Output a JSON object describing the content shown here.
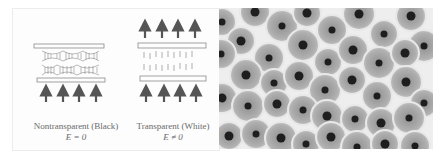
{
  "figure": {
    "left_panel": {
      "title": "Liquid crystal cell states",
      "cells": [
        {
          "name": "nontransparent",
          "label": "Nontransparent (Black)",
          "equation": "E = 0",
          "arrows_in": 4,
          "arrows_out": 0
        },
        {
          "name": "transparent",
          "label": "Transparent (White)",
          "equation": "E ≠ 0",
          "arrows_in": 4,
          "arrows_out": 4
        }
      ]
    },
    "right_panel": {
      "type": "micrograph",
      "description": "Hexagonally packed droplets with dark centers"
    },
    "colors": {
      "line": "#8a8a8a",
      "arrow": "#555555",
      "text": "#6a6a6a",
      "cell_bg": "#a9a9a9",
      "cell_border": "#f0f0f0",
      "droplet_core": "#1e1e1e"
    }
  }
}
